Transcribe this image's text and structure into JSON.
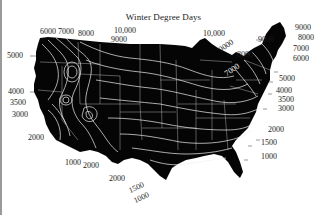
{
  "title": "Winter Degree Days",
  "colors": {
    "land": "#050505",
    "contour": "#e8e8e8",
    "background": "#ffffff",
    "label": "#1a1a1a"
  },
  "labels": {
    "west": {
      "l6000": "6000",
      "l7000": "7000",
      "l8000": "8000",
      "l5000": "5000",
      "l4000": "4000",
      "l3500": "3500",
      "l3000": "3000",
      "l2000": "2000"
    },
    "north": {
      "l10000a": "10,000",
      "l9000a": "9000",
      "l10000b": "10,000",
      "l9000b": "9000",
      "l8000": "8000",
      "l7000": "7000"
    },
    "northeast": {
      "l9000a": "9000",
      "l9000b": "9000",
      "l8000": "8000",
      "l7000": "7000",
      "l6000": "6000",
      "l5000": "5000",
      "l4000": "4000",
      "l3500": "3500",
      "l3000": "3000"
    },
    "southeast": {
      "l2000": "2000",
      "l1500": "1500",
      "l1000": "1000"
    },
    "south": {
      "l1000": "1000",
      "l2000a": "2000",
      "l2000b": "2000",
      "l1500": "1500",
      "l1000b": "1000"
    }
  }
}
